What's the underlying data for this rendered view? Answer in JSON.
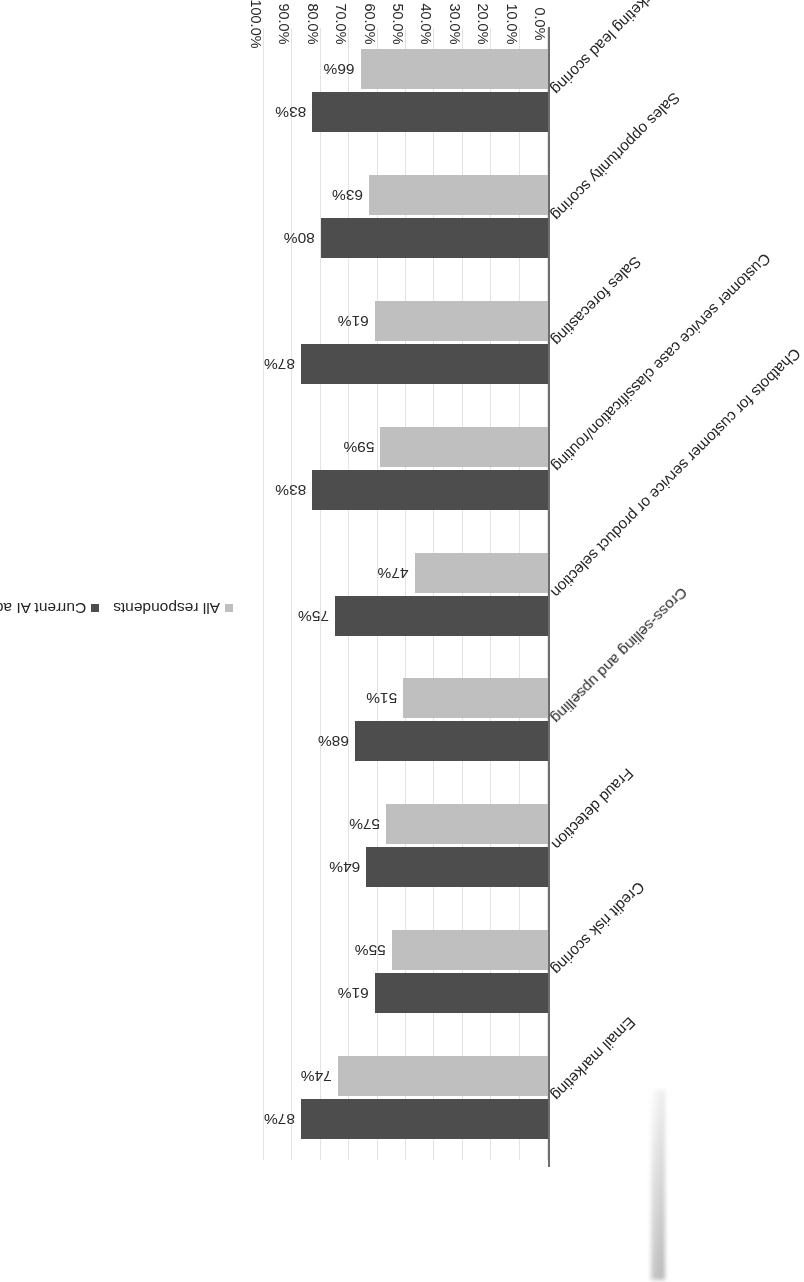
{
  "chart_data": {
    "type": "bar",
    "orientation": "horizontal",
    "title": "",
    "xlabel": "Share of respondents using or planning to use",
    "ylabel": "",
    "xlim": [
      0,
      1.0
    ],
    "grid": true,
    "legend_position": "top-left",
    "value_format": "percent",
    "tick_labels": [
      "0.0%",
      "10.0%",
      "20.0%",
      "30.0%",
      "40.0%",
      "50.0%",
      "60.0%",
      "70.0%",
      "80.0%",
      "90.0%",
      "100.0%"
    ],
    "tick_values": [
      0,
      10,
      20,
      30,
      40,
      50,
      60,
      70,
      80,
      90,
      100
    ],
    "categories": [
      "Sales and marketing lead scoring",
      "Sales opportunity scoring",
      "Sales forecasting",
      "Customer service case classification/routing",
      "Chatbots for customer service or product selection",
      "Cross-selling and upselling",
      "Fraud detection",
      "Credit risk scoring",
      "Email marketing"
    ],
    "series": [
      {
        "name": "All respondents",
        "color": "#bfbfbf",
        "values": [
          66,
          63,
          61,
          59,
          47,
          51,
          57,
          55,
          74
        ],
        "labels": [
          "66%",
          "63%",
          "61%",
          "59%",
          "47%",
          "51%",
          "57%",
          "55%",
          "74%"
        ]
      },
      {
        "name": "Current AI adopters",
        "color": "#4d4d4d",
        "values": [
          83,
          80,
          87,
          83,
          75,
          68,
          64,
          61,
          87
        ],
        "labels": [
          "83%",
          "80%",
          "87%",
          "83%",
          "75%",
          "68%",
          "64%",
          "61%",
          "87%"
        ]
      }
    ]
  },
  "legend": {
    "entries": [
      {
        "label": "All respondents",
        "color": "#bfbfbf"
      },
      {
        "label": "Current AI adopters",
        "color": "#4d4d4d"
      }
    ]
  },
  "axis": {
    "value_axis_title": "Share of respondents using or planning to use"
  }
}
